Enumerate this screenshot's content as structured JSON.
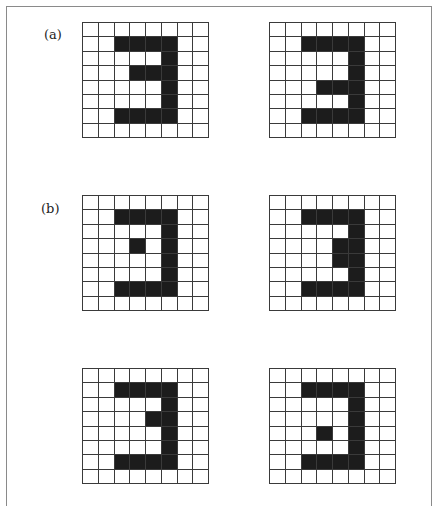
{
  "figure": {
    "labels": {
      "a": "(a)",
      "b": "(b)"
    },
    "grid_size": {
      "rows": 8,
      "cols": 8
    },
    "colors": {
      "filled": "#1c1c1c",
      "empty": "#ffffff",
      "lines": "#3a3a3a"
    },
    "grids": [
      {
        "id": "a-left",
        "group": "a",
        "pattern": [
          "00000000",
          "00111100",
          "00000100",
          "00011100",
          "00000100",
          "00000100",
          "00111100",
          "00000000"
        ]
      },
      {
        "id": "a-right",
        "group": "a",
        "pattern": [
          "00000000",
          "00111100",
          "00000100",
          "00000100",
          "00011100",
          "00000100",
          "00111100",
          "00000000"
        ]
      },
      {
        "id": "b-top-left",
        "group": "b",
        "pattern": [
          "00000000",
          "00111100",
          "00000100",
          "00010100",
          "00000100",
          "00000100",
          "00111100",
          "00000000"
        ]
      },
      {
        "id": "b-top-right",
        "group": "b",
        "pattern": [
          "00000000",
          "00111100",
          "00000100",
          "00001100",
          "00001100",
          "00000100",
          "00111100",
          "00000000"
        ]
      },
      {
        "id": "b-bottom-left",
        "group": "b",
        "pattern": [
          "00000000",
          "00111100",
          "00000100",
          "00001100",
          "00000100",
          "00000100",
          "00111100",
          "00000000"
        ]
      },
      {
        "id": "b-bottom-right",
        "group": "b",
        "pattern": [
          "00000000",
          "00111100",
          "00000100",
          "00000100",
          "00010100",
          "00000100",
          "00111100",
          "00000000"
        ]
      }
    ]
  }
}
